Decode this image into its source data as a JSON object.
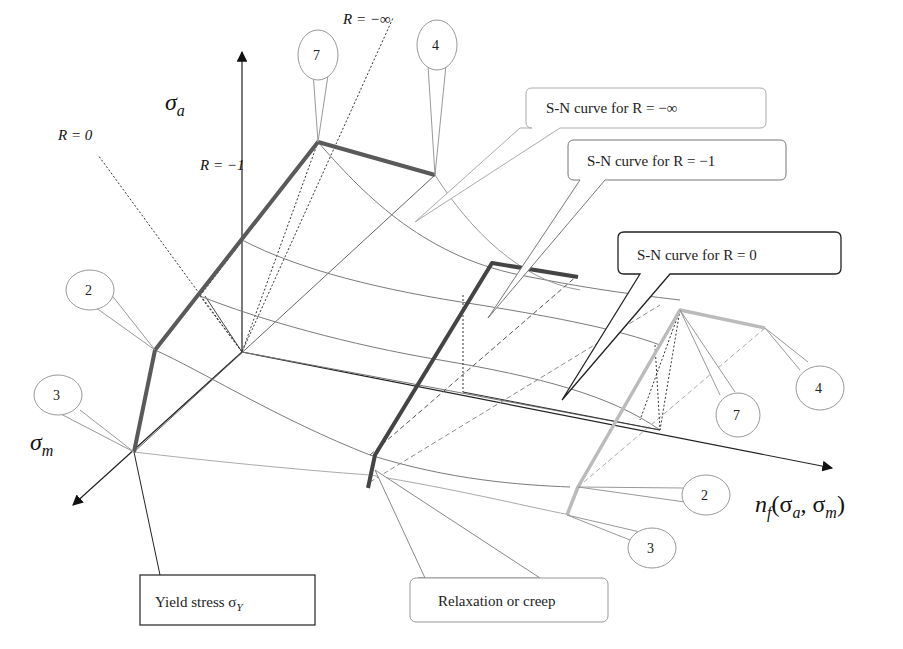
{
  "axes": {
    "sigma_a": {
      "label": "σ",
      "sub": "a"
    },
    "sigma_m": {
      "label": "σ",
      "sub": "m"
    },
    "n_f": {
      "label": "n",
      "sub": "f",
      "args": "(σ",
      "args_sub1": "a",
      "args_mid": ", σ",
      "args_sub2": "m",
      "args_end": ")"
    }
  },
  "r_lines": {
    "r_neg_inf": "R = −∞",
    "r_neg_one": "R = −1",
    "r_zero": "R = 0"
  },
  "callouts": {
    "sn_neg_inf": "S-N curve for R = −∞",
    "sn_neg_one": "S-N curve for R = −1",
    "sn_zero": "S-N curve for R = 0",
    "yield": "Yield stress σ",
    "yield_sub": "Y",
    "relax": "Relaxation or creep"
  },
  "markers": {
    "m7_top": "7",
    "m4_top": "4",
    "m2_left": "2",
    "m3_left": "3",
    "m4_right": "4",
    "m7_right": "7",
    "m2_right": "2",
    "m3_right": "3"
  },
  "colors": {
    "dark_path": "#5a5a5a",
    "mid_path": "#444444",
    "light_path": "#b8b8b8",
    "curve": "#6e6e6e",
    "light_curve": "#9a9a9a",
    "dark_callout_border": "#222222"
  }
}
